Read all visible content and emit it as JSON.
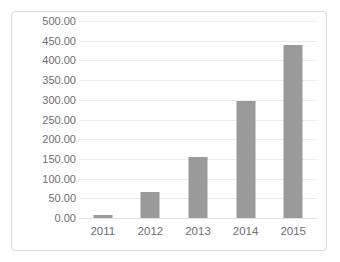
{
  "chart_data": {
    "type": "bar",
    "title": "",
    "xlabel": "",
    "ylabel": "",
    "categories": [
      "2011",
      "2012",
      "2013",
      "2014",
      "2015"
    ],
    "values": [
      8,
      65,
      155,
      298,
      440
    ],
    "ylim": [
      0,
      500
    ],
    "ytick_step": 50,
    "ytick_labels": [
      "0.00",
      "50.00",
      "100.00",
      "150.00",
      "200.00",
      "250.00",
      "300.00",
      "350.00",
      "400.00",
      "450.00",
      "500.00"
    ],
    "grid": true,
    "legend": false,
    "legend_position": "none",
    "series": [
      {
        "name": "Series 1",
        "values": [
          8,
          65,
          155,
          298,
          440
        ]
      }
    ],
    "colors": {
      "bar": "#9a9a9a",
      "gridline": "#ededf0",
      "baseline": "#e2e2e5",
      "frame_border": "#dcdcdf",
      "tick_label": "#6e6e72",
      "background": "#ffffff"
    }
  }
}
